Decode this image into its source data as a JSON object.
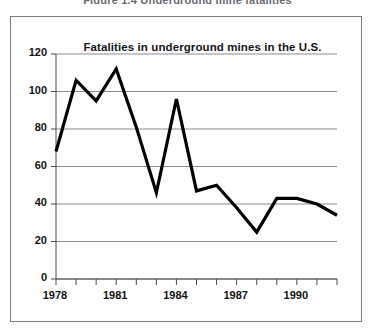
{
  "figure": {
    "caption": "Figure 1.4  Underground mine fatalities"
  },
  "chart_data": {
    "type": "line",
    "title": "Fatalities in underground mines in the U.S.",
    "xlabel": "",
    "ylabel": "",
    "x": [
      1978,
      1979,
      1980,
      1981,
      1982,
      1983,
      1984,
      1985,
      1986,
      1987,
      1988,
      1989,
      1990,
      1991,
      1992
    ],
    "values": [
      68,
      106,
      95,
      112,
      81,
      46,
      96,
      47,
      50,
      38,
      25,
      43,
      43,
      40,
      34
    ],
    "series": [
      {
        "name": "Fatalities",
        "values": [
          68,
          106,
          95,
          112,
          81,
          46,
          96,
          47,
          50,
          38,
          25,
          43,
          43,
          40,
          34
        ]
      }
    ],
    "xlim": [
      1978,
      1992
    ],
    "ylim": [
      0,
      120
    ],
    "ytick_values": [
      0,
      20,
      40,
      60,
      80,
      100,
      120
    ],
    "ytick_labels": [
      "0",
      "20",
      "40",
      "60",
      "80",
      "100",
      "120"
    ],
    "xtick_values": [
      1978,
      1979,
      1980,
      1981,
      1982,
      1983,
      1984,
      1985,
      1986,
      1987,
      1988,
      1989,
      1990,
      1991,
      1992
    ],
    "xtick_labels": [
      "1978",
      "",
      "",
      "1981",
      "",
      "",
      "1984",
      "",
      "",
      "1987",
      "",
      "",
      "1990",
      "",
      ""
    ],
    "grid": "horizontal",
    "legend": "none",
    "line_color": "#000000",
    "grid_color": "#8c8c92",
    "axis_color": "#4b4b50"
  }
}
